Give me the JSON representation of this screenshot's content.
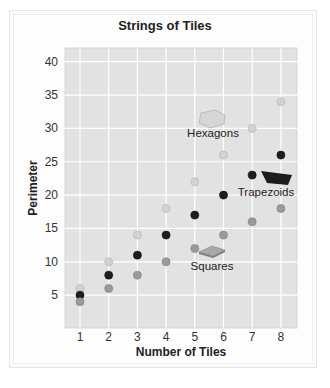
{
  "chart_data": {
    "type": "scatter",
    "title": "Strings of Tiles",
    "xlabel": "Number of Tiles",
    "ylabel": "Perimeter",
    "x": [
      1,
      2,
      3,
      4,
      5,
      6,
      7,
      8
    ],
    "xlim": [
      0.5,
      8.5
    ],
    "ylim": [
      0,
      42
    ],
    "xticks": [
      "1",
      "2",
      "3",
      "4",
      "5",
      "6",
      "7",
      "8"
    ],
    "yticks": [
      "5",
      "10",
      "15",
      "20",
      "25",
      "30",
      "35",
      "40"
    ],
    "grid": true,
    "legend": "inline annotations with tile shapes",
    "series": [
      {
        "name": "Hexagons",
        "color": "#d2d2d2",
        "values": [
          6,
          10,
          14,
          18,
          22,
          26,
          30,
          34
        ]
      },
      {
        "name": "Trapezoids",
        "color": "#1e1e1e",
        "values": [
          5,
          8,
          11,
          14,
          17,
          20,
          23,
          26
        ]
      },
      {
        "name": "Squares",
        "color": "#9a9a9a",
        "values": [
          4,
          6,
          8,
          10,
          12,
          14,
          16,
          18
        ]
      }
    ],
    "annotations": [
      {
        "label": "Hexagons",
        "shape": "hexagon"
      },
      {
        "label": "Trapezoids",
        "shape": "trapezoid"
      },
      {
        "label": "Squares",
        "shape": "square"
      }
    ]
  },
  "colors": {
    "plot_bg": "#e2e2e2",
    "grid": "#ffffff",
    "hexagon_fill": "#d6d6d6",
    "trapezoid_fill": "#1c1c1c",
    "square_fill": "#a8a8a8"
  }
}
